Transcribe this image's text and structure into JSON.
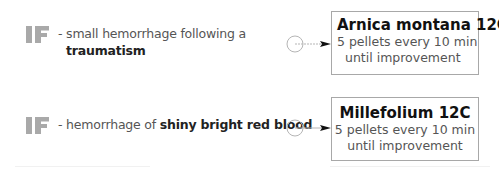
{
  "rules": [
    {
      "if_label": "IF",
      "condition_prefix": "- small hemorrhage following a",
      "condition_emphasis": "traumatism",
      "remedy": {
        "name": "Arnica montana 12C",
        "dose_line1": "5 pellets every 10 min",
        "dose_line2": "until improvement"
      }
    },
    {
      "if_label": "IF",
      "condition_prefix": "- hemorrhage of",
      "condition_emphasis": "shiny bright red blood",
      "remedy": {
        "name": "Millefolium 12C",
        "dose_line1": "5 pellets every 10 min",
        "dose_line2": "until improvement"
      }
    }
  ],
  "colors": {
    "if_mark": "#a9a9a9",
    "box_border": "#a8a8a8",
    "connector": "#b5b5b5",
    "arrowhead": "#111111"
  }
}
